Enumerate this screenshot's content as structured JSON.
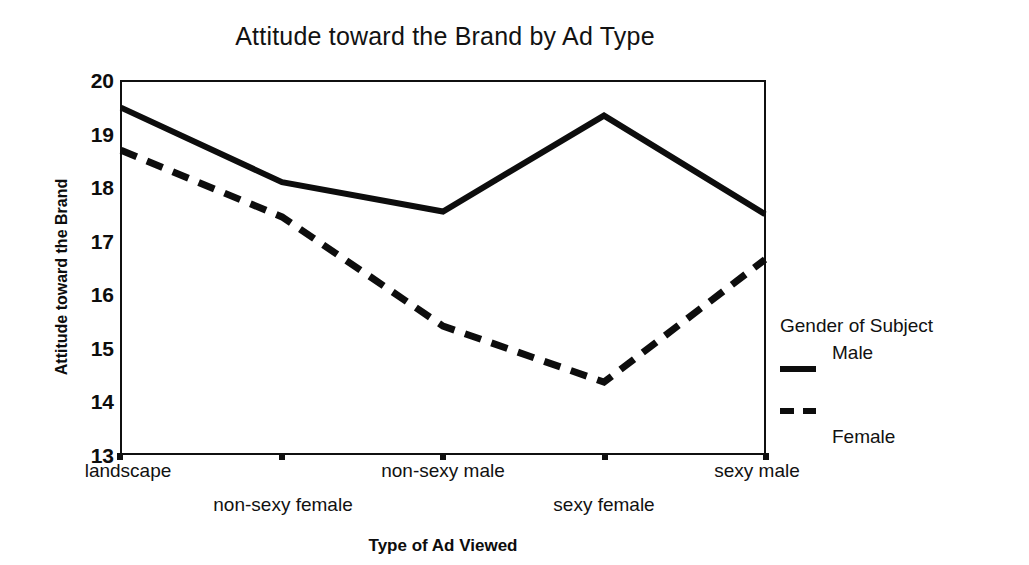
{
  "chart_data": {
    "type": "line",
    "title": "Attitude toward the Brand by Ad Type",
    "xlabel": "Type of Ad Viewed",
    "ylabel": "Attitude toward the Brand",
    "categories": [
      "landscape",
      "non-sexy female",
      "non-sexy male",
      "sexy female",
      "sexy male"
    ],
    "ylim": [
      13,
      20
    ],
    "yticks": [
      13,
      14,
      15,
      16,
      17,
      18,
      19,
      20
    ],
    "grid": false,
    "legend_position": "right",
    "legend_title": "Gender of Subject",
    "series": [
      {
        "name": "Male",
        "style": "solid",
        "color": "#0d0d0d",
        "values": [
          19.5,
          18.1,
          17.55,
          19.35,
          17.5
        ]
      },
      {
        "name": "Female",
        "style": "dashed",
        "color": "#0d0d0d",
        "values": [
          18.7,
          17.45,
          15.4,
          14.35,
          16.65
        ]
      }
    ]
  },
  "chart": {
    "title": "Attitude toward the Brand by Ad Type",
    "y_axis": {
      "title": "Attitude toward the Brand",
      "ticklabels": [
        "20",
        "19",
        "18",
        "17",
        "16",
        "15",
        "14",
        "13"
      ]
    },
    "x_axis": {
      "title": "Type of Ad Viewed",
      "ticklabels": [
        "landscape",
        "non-sexy female",
        "non-sexy male",
        "sexy female",
        "sexy male"
      ]
    },
    "legend": {
      "title": "Gender of Subject",
      "entries": [
        {
          "label": "Male",
          "style": "solid"
        },
        {
          "label": "Female",
          "style": "dashed"
        }
      ]
    }
  }
}
